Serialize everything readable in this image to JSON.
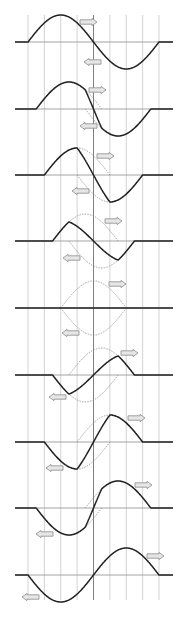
{
  "diagram": {
    "title": "",
    "colors": {
      "background": "#ffffff",
      "grid": "#c8c8c8",
      "center_line": "#808080",
      "axis": "#999999",
      "resultant": "#222222",
      "component_dotted": "#888888",
      "arrow_fill": "#e6e6e6",
      "arrow_stroke": "#8c8c8c"
    },
    "geometry": {
      "x_left": 28,
      "x_right": 159,
      "grid_divisions": 8,
      "axis_extend_left": 15,
      "axis_extend_right": 173,
      "grid_top": 15,
      "grid_bottom": 600,
      "amplitude": 27,
      "pulse_width_units": 4,
      "shift_units_per_step": 0.5
    },
    "panels": [
      {
        "index": 0,
        "axis_y": 42,
        "right_arrow": [
          80,
          22
        ],
        "left_arrow": [
          84,
          62
        ]
      },
      {
        "index": 1,
        "axis_y": 109,
        "right_arrow": [
          89,
          90
        ],
        "left_arrow": [
          80,
          126
        ]
      },
      {
        "index": 2,
        "axis_y": 175,
        "right_arrow": [
          97,
          156
        ],
        "left_arrow": [
          72,
          191
        ]
      },
      {
        "index": 3,
        "axis_y": 241,
        "right_arrow": [
          105,
          221
        ],
        "left_arrow": [
          63,
          258
        ]
      },
      {
        "index": 4,
        "axis_y": 308,
        "right_arrow": [
          109,
          284
        ],
        "left_arrow": [
          62,
          333
        ]
      },
      {
        "index": 5,
        "axis_y": 375,
        "right_arrow": [
          121,
          353
        ],
        "left_arrow": [
          49,
          397
        ]
      },
      {
        "index": 6,
        "axis_y": 442,
        "right_arrow": [
          128,
          418
        ],
        "left_arrow": [
          46,
          468
        ]
      },
      {
        "index": 7,
        "axis_y": 508,
        "right_arrow": [
          135,
          485
        ],
        "left_arrow": [
          36,
          534
        ]
      },
      {
        "index": 8,
        "axis_y": 575,
        "right_arrow": [
          147,
          556
        ],
        "left_arrow": [
          22,
          597
        ]
      }
    ],
    "legend": {
      "resultant": "solid line = resultant displacement",
      "components": "dotted lines = individual pulses",
      "arrows": "block arrows = direction of travel"
    }
  }
}
